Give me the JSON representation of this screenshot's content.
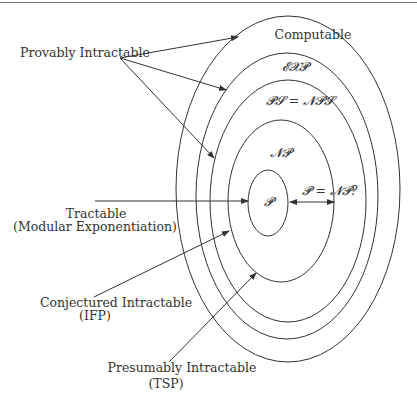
{
  "diagram": {
    "type": "nested-ellipses",
    "classes": [
      {
        "id": "computable",
        "label": "Computable"
      },
      {
        "id": "exp",
        "label": "𝓔𝓧𝓟"
      },
      {
        "id": "ps",
        "label": "𝓟𝓢 = 𝓝𝓟𝓢"
      },
      {
        "id": "np",
        "label": "𝓝𝓟"
      },
      {
        "id": "p",
        "label": "𝓟"
      }
    ],
    "gap_label": "𝓟 = 𝓝𝓟?",
    "annotations": {
      "provably": "Provably Intractable",
      "tractable_line1": "Tractable",
      "tractable_line2": "(Modular Exponentiation)",
      "conjectured_line1": "Conjectured Intractable",
      "conjectured_line2": "(IFP)",
      "presumably_line1": "Presumably Intractable",
      "presumably_line2": "(TSP)"
    },
    "colors": {
      "stroke": "#333333",
      "background": "#ffffff"
    }
  }
}
